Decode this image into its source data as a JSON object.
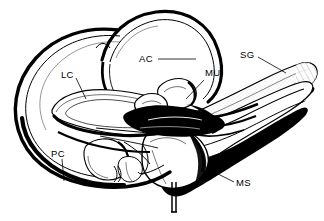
{
  "figure": {
    "type": "anatomical-line-drawing",
    "background_color": "#ffffff",
    "ink_color": "#000000",
    "width": 324,
    "height": 221
  },
  "labels": [
    {
      "id": "ac",
      "text": "AC",
      "meaning": "anterior semicircular canal",
      "x": 139,
      "y": 62,
      "leader": {
        "x1": 158,
        "y1": 59,
        "x2": 196,
        "y2": 59
      }
    },
    {
      "id": "lc",
      "text": "LC",
      "meaning": "lateral semicircular canal",
      "x": 61,
      "y": 78,
      "leader": {
        "x1": 76,
        "y1": 78,
        "x2": 86,
        "y2": 98
      }
    },
    {
      "id": "pc",
      "text": "PC",
      "meaning": "posterior semicircular canal",
      "x": 51,
      "y": 157,
      "leader": {
        "x1": 62,
        "y1": 158,
        "x2": 64,
        "y2": 181
      }
    },
    {
      "id": "mu",
      "text": "MU",
      "meaning": "macula utriculi",
      "x": 205,
      "y": 76,
      "leader": {
        "x1": 204,
        "y1": 79,
        "x2": 186,
        "y2": 98
      }
    },
    {
      "id": "sg",
      "text": "SG",
      "meaning": "spiral ganglion / nerve trunk",
      "x": 240,
      "y": 58,
      "leader": {
        "x1": 258,
        "y1": 57,
        "x2": 286,
        "y2": 73
      }
    },
    {
      "id": "ms",
      "text": "MS",
      "meaning": "macula sacculi",
      "x": 236,
      "y": 186,
      "leader": {
        "x1": 234,
        "y1": 182,
        "x2": 214,
        "y2": 172
      }
    }
  ]
}
